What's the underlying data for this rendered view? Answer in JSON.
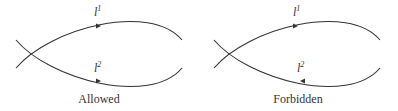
{
  "panels": [
    {
      "id": "allowed",
      "caption": "Allowed",
      "top_line": {
        "symbol": "l",
        "superscript": "1",
        "arrow": "right"
      },
      "bottom_line": {
        "symbol": "l",
        "superscript": "2",
        "arrow": "right"
      }
    },
    {
      "id": "forbidden",
      "caption": "Forbidden",
      "top_line": {
        "symbol": "l",
        "superscript": "1",
        "arrow": "right"
      },
      "bottom_line": {
        "symbol": "l",
        "superscript": "2",
        "arrow": "left"
      }
    }
  ],
  "colors": {
    "stroke": "#333333",
    "background": "#ffffff"
  }
}
